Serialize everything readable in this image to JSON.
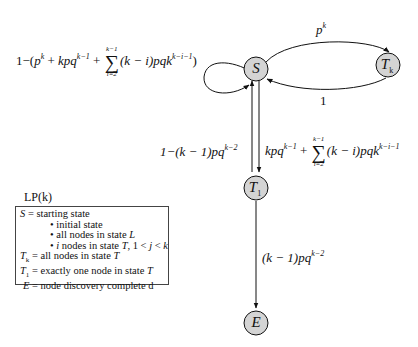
{
  "diagram": {
    "nodes": [
      {
        "id": "S",
        "label": "S",
        "subscript": "",
        "fill": "#d4d4d4"
      },
      {
        "id": "Tk",
        "label": "T",
        "subscript": "k",
        "fill": "#d4d4d4"
      },
      {
        "id": "T1",
        "label": "T",
        "subscript": "1",
        "fill": "#d4d4d4"
      },
      {
        "id": "E",
        "label": "E",
        "subscript": "",
        "fill": "#d4d4d4"
      }
    ],
    "edges": {
      "self_loop_S": {
        "prefix": "1−(",
        "p_base": "p",
        "p_exp": "k",
        "plus1": " + ",
        "kpq": "kpq",
        "kpq_exp": "k−1",
        "plus2": " + ",
        "sum_top": "k−1",
        "sum_bot": "i=2",
        "term": "(k − i)",
        "pqk": "pqk",
        "pqk_exp": "k−i−1",
        "suffix": ")"
      },
      "S_to_Tk": {
        "base": "p",
        "exp": "k"
      },
      "Tk_to_S": {
        "text": "1"
      },
      "T1_to_S": {
        "prefix": "1−(k − 1)",
        "pq": "pq",
        "exp": "k−2"
      },
      "S_to_T1": {
        "kpq": "kpq",
        "kpq_exp": "k−1",
        "plus": " + ",
        "sum_top": "k−1",
        "sum_bot": "i=2",
        "term": "(k − i)",
        "pqk": "pqk",
        "pqk_exp": "k−i−1"
      },
      "T1_to_E": {
        "prefix": "(k − 1)",
        "pq": "pq",
        "exp": "k−2"
      }
    },
    "legend": {
      "title": "LP(k)",
      "lines": [
        {
          "sym": "S",
          "sub": "",
          "text": " = starting state"
        },
        {
          "bullet": "• initial state"
        },
        {
          "bullet": "• all nodes in state ",
          "ital": "L"
        },
        {
          "bullet": "• ",
          "ital": "i",
          "rest": " nodes in state ",
          "ital2": "T",
          "rest2": ", 1 < ",
          "ital3": "j",
          "rest3": " < ",
          "ital4": "k"
        },
        {
          "sym": "T",
          "sub": "k",
          "text": " = all nodes in state ",
          "ital": "T"
        },
        {
          "sym": "T",
          "sub": "1",
          "text": " = exactly one node in state ",
          "ital": "T"
        },
        {
          "sym": "E",
          "sub": "",
          "text": " = node discovery complete d"
        }
      ]
    }
  }
}
